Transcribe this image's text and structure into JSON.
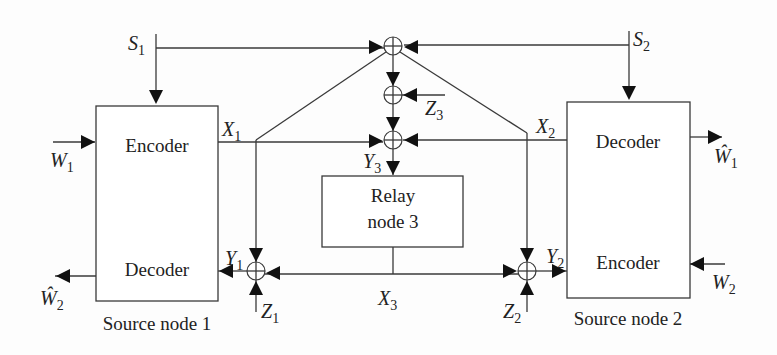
{
  "diagram": {
    "type": "block-diagram",
    "nodes": {
      "source1": {
        "label": "Source node 1",
        "encoder": "Encoder",
        "decoder": "Decoder"
      },
      "source2": {
        "label": "Source node 2",
        "encoder": "Encoder",
        "decoder": "Decoder"
      },
      "relay": {
        "line1": "Relay",
        "line2": "node 3"
      }
    },
    "signals": {
      "S1": {
        "base": "S",
        "sub": "1"
      },
      "S2": {
        "base": "S",
        "sub": "2"
      },
      "X1": {
        "base": "X",
        "sub": "1"
      },
      "X2": {
        "base": "X",
        "sub": "2"
      },
      "X3": {
        "base": "X",
        "sub": "3"
      },
      "Y1": {
        "base": "Y",
        "sub": "1"
      },
      "Y2": {
        "base": "Y",
        "sub": "2"
      },
      "Y3": {
        "base": "Y",
        "sub": "3"
      },
      "Z1": {
        "base": "Z",
        "sub": "1"
      },
      "Z2": {
        "base": "Z",
        "sub": "2"
      },
      "Z3": {
        "base": "Z",
        "sub": "3"
      },
      "W1": {
        "base": "W",
        "sub": "1"
      },
      "W2": {
        "base": "W",
        "sub": "2"
      },
      "W1hat": {
        "base": "Ŵ",
        "sub": "1"
      },
      "W2hat": {
        "base": "Ŵ",
        "sub": "2"
      }
    },
    "edges": [
      {
        "from": "W1",
        "to": "source1.encoder"
      },
      {
        "from": "S1",
        "to": "source1.encoder"
      },
      {
        "from": "S1",
        "to": "sum_top"
      },
      {
        "from": "S2",
        "to": "sum_top"
      },
      {
        "from": "S2",
        "to": "source2.decoder"
      },
      {
        "from": "sum_top",
        "to": "sum_z3"
      },
      {
        "from": "Z3",
        "to": "sum_z3"
      },
      {
        "from": "sum_z3",
        "to": "sum_y3"
      },
      {
        "from": "X1",
        "to": "sum_y3"
      },
      {
        "from": "X2",
        "to": "sum_y3"
      },
      {
        "from": "sum_y3",
        "to": "relay",
        "label": "Y3"
      },
      {
        "from": "sum_top",
        "to": "sum_y1"
      },
      {
        "from": "X2",
        "to": "sum_y1"
      },
      {
        "from": "X3",
        "to": "sum_y1"
      },
      {
        "from": "Z1",
        "to": "sum_y1"
      },
      {
        "from": "sum_y1",
        "to": "source1.decoder",
        "label": "Y1"
      },
      {
        "from": "sum_top",
        "to": "sum_y2"
      },
      {
        "from": "X1",
        "to": "sum_y2"
      },
      {
        "from": "X3",
        "to": "sum_y2"
      },
      {
        "from": "Z2",
        "to": "sum_y2"
      },
      {
        "from": "sum_y2",
        "to": "source2.encoder",
        "label": "Y2"
      },
      {
        "from": "source1.decoder",
        "to": "W2hat"
      },
      {
        "from": "source2.decoder",
        "to": "W1hat"
      },
      {
        "from": "W2",
        "to": "source2.encoder"
      }
    ]
  }
}
